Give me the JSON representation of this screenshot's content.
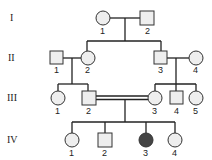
{
  "colors": {
    "line": "#222222",
    "unaffected_fill": "#eeeeee",
    "affected_fill": "#444444"
  },
  "generations": [
    {
      "label": "I",
      "y": 48
    },
    {
      "label": "II",
      "y": 88
    },
    {
      "label": "III",
      "y": 128
    },
    {
      "label": "IV",
      "y": 168
    }
  ],
  "individuals": {
    "I": [
      {
        "id": "I-1",
        "number": "1",
        "sex": "female",
        "affected": false
      },
      {
        "id": "I-2",
        "number": "2",
        "sex": "male",
        "affected": false
      }
    ],
    "II": [
      {
        "id": "II-1",
        "number": "1",
        "sex": "male",
        "affected": false
      },
      {
        "id": "II-2",
        "number": "2",
        "sex": "female",
        "affected": false
      },
      {
        "id": "II-3",
        "number": "3",
        "sex": "male",
        "affected": false
      },
      {
        "id": "II-4",
        "number": "4",
        "sex": "female",
        "affected": false
      }
    ],
    "III": [
      {
        "id": "III-1",
        "number": "1",
        "sex": "female",
        "affected": false
      },
      {
        "id": "III-2",
        "number": "2",
        "sex": "male",
        "affected": false
      },
      {
        "id": "III-3",
        "number": "3",
        "sex": "female",
        "affected": false
      },
      {
        "id": "III-4",
        "number": "4",
        "sex": "male",
        "affected": false
      },
      {
        "id": "III-5",
        "number": "5",
        "sex": "female",
        "affected": false
      }
    ],
    "IV": [
      {
        "id": "IV-1",
        "number": "1",
        "sex": "female",
        "affected": false
      },
      {
        "id": "IV-2",
        "number": "2",
        "sex": "male",
        "affected": false
      },
      {
        "id": "IV-3",
        "number": "3",
        "sex": "female",
        "affected": true
      },
      {
        "id": "IV-4",
        "number": "4",
        "sex": "female",
        "affected": false
      }
    ]
  },
  "unions": [
    {
      "partners": [
        "I-1",
        "I-2"
      ],
      "consanguineous": false,
      "children": [
        "II-2",
        "II-3"
      ]
    },
    {
      "partners": [
        "II-1",
        "II-2"
      ],
      "consanguineous": false,
      "children": [
        "III-1",
        "III-2"
      ]
    },
    {
      "partners": [
        "II-3",
        "II-4"
      ],
      "consanguineous": false,
      "children": [
        "III-3",
        "III-4",
        "III-5"
      ]
    },
    {
      "partners": [
        "III-2",
        "III-3"
      ],
      "consanguineous": true,
      "children": [
        "IV-1",
        "IV-2",
        "IV-3",
        "IV-4"
      ]
    }
  ]
}
